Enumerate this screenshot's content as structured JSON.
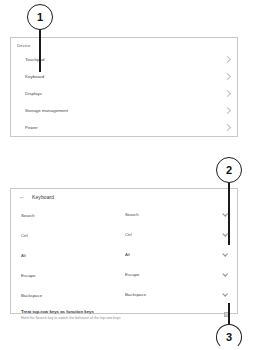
{
  "callouts": [
    {
      "number": "1"
    },
    {
      "number": "2"
    },
    {
      "number": "3"
    }
  ],
  "device_panel": {
    "section_title": "Device",
    "rows": [
      {
        "label": "Touchpad",
        "icon": "chevron-right-icon"
      },
      {
        "label": "Keyboard",
        "icon": "chevron-right-icon"
      },
      {
        "label": "Displays",
        "icon": "chevron-right-icon"
      },
      {
        "label": "Storage management",
        "icon": "chevron-right-icon"
      },
      {
        "label": "Power",
        "icon": "chevron-right-icon"
      }
    ]
  },
  "keyboard_panel": {
    "back_icon": "back-arrow-icon",
    "back_arrow_glyph": "←",
    "title": "Keyboard",
    "mappings": [
      {
        "key": "Search",
        "value": "Search"
      },
      {
        "key": "Ctrl",
        "value": "Ctrl"
      },
      {
        "key": "Alt",
        "value": "Alt"
      },
      {
        "key": "Escape",
        "value": "Escape"
      },
      {
        "key": "Backspace",
        "value": "Backspace"
      }
    ],
    "function_keys": {
      "title": "Treat top-row keys as function keys",
      "subtitle": "Hold the Search key to switch the behavior of the top-row keys",
      "checkbox_icon": "checkbox-icon"
    }
  }
}
